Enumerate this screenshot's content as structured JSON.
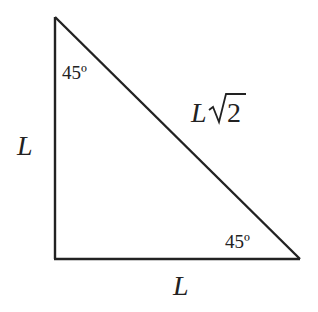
{
  "diagram": {
    "type": "right-isosceles-triangle",
    "stroke_color": "#222222",
    "background": "#ffffff",
    "vertices": {
      "top": [
        55,
        17
      ],
      "bottom_left": [
        55,
        259
      ],
      "bottom_right": [
        300,
        259
      ]
    },
    "labels": {
      "left_side": "L",
      "bottom_side": "L",
      "hypotenuse_prefix": "L",
      "hypotenuse_radicand": "2",
      "top_angle": "45º",
      "bottom_right_angle": "45º"
    }
  }
}
